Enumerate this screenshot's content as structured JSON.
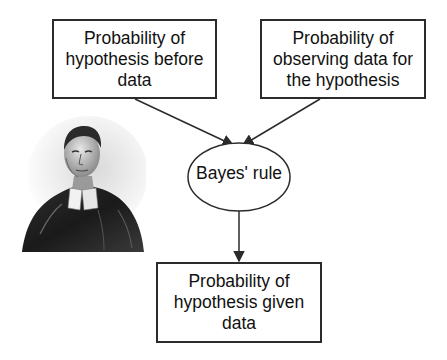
{
  "diagram": {
    "type": "flow",
    "nodes": {
      "prior": {
        "label": "Probability of\nhypothesis before\ndata",
        "shape": "rectangle"
      },
      "likelihood": {
        "label": "Probability of\nobserving data for\nthe hypothesis",
        "shape": "rectangle"
      },
      "bayes_rule": {
        "label": "Bayes' rule",
        "shape": "ellipse"
      },
      "posterior": {
        "label": "Probability of\nhypothesis given\ndata",
        "shape": "rectangle"
      }
    },
    "edges": [
      {
        "from": "prior",
        "to": "bayes_rule"
      },
      {
        "from": "likelihood",
        "to": "bayes_rule"
      },
      {
        "from": "bayes_rule",
        "to": "posterior"
      }
    ],
    "image": {
      "subject": "portrait-engraving",
      "alt": "Portrait of Thomas Bayes"
    },
    "colors": {
      "stroke": "#2b2b2b",
      "text": "#111111",
      "background": "#ffffff"
    }
  }
}
